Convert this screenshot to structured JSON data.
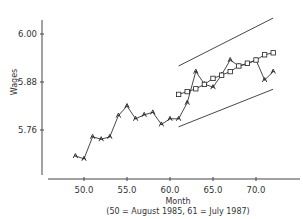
{
  "chart_data": {
    "type": "line",
    "title": "",
    "xlabel": "Month",
    "xlabel_note": "(50 = August 1985, 61 = July 1987)",
    "ylabel": "Wages",
    "xlim": [
      46,
      74
    ],
    "ylim": [
      5.64,
      6.1
    ],
    "x_ticks": [
      "50.0",
      "55.0",
      "60.0",
      "65.0",
      "70.0"
    ],
    "x_tick_values": [
      50,
      55,
      60,
      65,
      70
    ],
    "y_ticks": [
      "5.76",
      "5.88",
      "6.00"
    ],
    "y_tick_values": [
      5.76,
      5.88,
      6.0
    ],
    "grid": false,
    "series": [
      {
        "name": "Actual",
        "marker": "triangle",
        "x": [
          49,
          50,
          51,
          52,
          53,
          54,
          55,
          56,
          57,
          58,
          59,
          60,
          61,
          62,
          63,
          64,
          65,
          66,
          67,
          68,
          69,
          70,
          71,
          72
        ],
        "values": [
          5.695,
          5.688,
          5.743,
          5.737,
          5.743,
          5.796,
          5.82,
          5.788,
          5.798,
          5.804,
          5.774,
          5.788,
          5.788,
          5.828,
          5.906,
          5.875,
          5.867,
          5.898,
          5.935,
          5.92,
          5.925,
          5.935,
          5.885,
          5.906
        ]
      },
      {
        "name": "Forecast",
        "marker": "square",
        "x": [
          61,
          62,
          63,
          64,
          65,
          66,
          67,
          68,
          69,
          70,
          71,
          72
        ],
        "values": [
          5.849,
          5.856,
          5.863,
          5.874,
          5.889,
          5.897,
          5.906,
          5.92,
          5.927,
          5.935,
          5.948,
          5.953
        ]
      },
      {
        "name": "Upper bound",
        "marker": "none",
        "x": [
          61,
          72
        ],
        "values": [
          5.92,
          6.04
        ]
      },
      {
        "name": "Lower bound",
        "marker": "none",
        "x": [
          61,
          72
        ],
        "values": [
          5.768,
          5.862
        ]
      }
    ]
  }
}
